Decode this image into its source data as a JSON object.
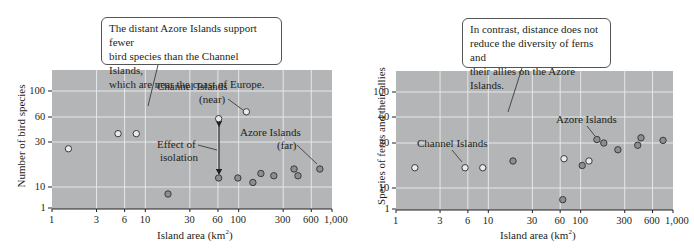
{
  "chart_data": [
    {
      "type": "scatter",
      "title": "",
      "xlabel": "Island area (km²)",
      "ylabel": "Number of bird species",
      "x_scale": "log",
      "xlim": [
        1,
        1000
      ],
      "ylim": [
        1,
        140
      ],
      "x_ticks": [
        "1",
        "3",
        "6",
        "10",
        "30",
        "60",
        "100",
        "300",
        "600",
        "1,000"
      ],
      "y_ticks": [
        "1",
        "10",
        "30",
        "60",
        "100"
      ],
      "grid": true,
      "callout": "The distant Azore Islands support fewer bird species than the Channel Islands, which are near the coast of Europe.",
      "annotations": [
        "Channel Islands",
        "(near)",
        "Azore Islands",
        "(far)",
        "Effect of",
        "isolation"
      ],
      "series": [
        {
          "name": "Channel Islands (near)",
          "marker": "hollow",
          "points": [
            [
              1.5,
              27
            ],
            [
              5.1,
              40
            ],
            [
              8,
              40
            ],
            [
              61,
              58
            ],
            [
              121,
              68
            ]
          ]
        },
        {
          "name": "Azore Islands (far)",
          "marker": "filled",
          "points": [
            [
              17.5,
              7
            ],
            [
              61,
              14
            ],
            [
              98,
              14
            ],
            [
              142,
              12
            ],
            [
              173,
              16
            ],
            [
              238,
              15
            ],
            [
              392,
              18
            ],
            [
              432,
              15
            ],
            [
              741,
              18
            ]
          ]
        }
      ]
    },
    {
      "type": "scatter",
      "title": "",
      "xlabel": "Island area (km²)",
      "ylabel": "Species of ferns and their allies",
      "x_scale": "log",
      "xlim": [
        1,
        1000
      ],
      "ylim": [
        1,
        140
      ],
      "x_ticks": [
        "1",
        "3",
        "6",
        "10",
        "30",
        "60",
        "100",
        "300",
        "600",
        "1,000"
      ],
      "y_ticks": [
        "1",
        "10",
        "30",
        "60",
        "100"
      ],
      "grid": true,
      "callout": "In contrast, distance does not reduce the diversity of ferns and their allies on the Azore Islands.",
      "annotations": [
        "Channel Islands",
        "Azore Islands"
      ],
      "series": [
        {
          "name": "Channel Islands",
          "marker": "hollow",
          "points": [
            [
              1.6,
              19
            ],
            [
              5.6,
              19
            ],
            [
              8.7,
              19
            ],
            [
              66,
              23
            ],
            [
              123,
              22
            ]
          ]
        },
        {
          "name": "Azore Islands",
          "marker": "filled",
          "points": [
            [
              18.5,
              22
            ],
            [
              64,
              5
            ],
            [
              104,
              20
            ],
            [
              150,
              34
            ],
            [
              178,
              30
            ],
            [
              253,
              27
            ],
            [
              415,
              29
            ],
            [
              450,
              36
            ],
            [
              780,
              33
            ]
          ]
        }
      ]
    }
  ],
  "left": {
    "callout_lines": [
      "The distant Azore Islands support fewer",
      "bird species than the Channel Islands,",
      "which are near the coast of Europe."
    ],
    "ylabel": "Number of bird species",
    "xlabel_main": "Island area (km",
    "xlabel_sup": "2",
    "xlabel_end": ")",
    "label_channel": "Channel Islands",
    "label_near": "(near)",
    "label_azore": "Azore Islands",
    "label_far": "(far)",
    "label_effect1": "Effect of",
    "label_effect2": "isolation"
  },
  "right": {
    "callout_lines": [
      "In contrast, distance does not",
      "reduce the diversity of ferns and",
      "their allies on the Azore Islands."
    ],
    "ylabel": "Species of ferns and their allies",
    "xlabel_main": "Island area (km",
    "xlabel_sup": "2",
    "xlabel_end": ")",
    "label_channel": "Channel Islands",
    "label_azore": "Azore Islands"
  },
  "colors": {
    "plot_bg": "#b4b5b7",
    "grid": "#e6e7e8",
    "hollow_fill": "#e9eaeb",
    "filled_fill": "#8c8e90",
    "marker_stroke": "#3b3b3b",
    "axis": "#231f20"
  }
}
